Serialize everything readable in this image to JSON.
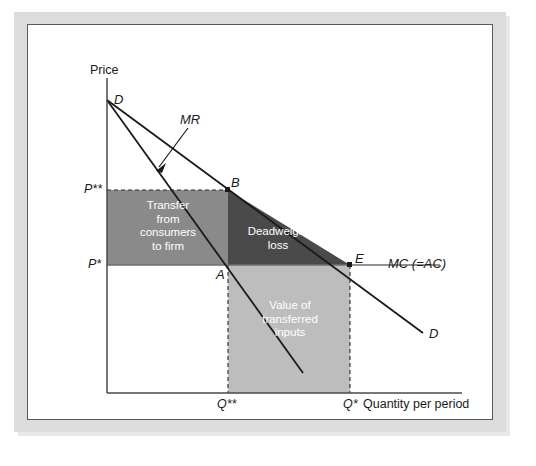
{
  "figure": {
    "kind": "economics-diagram",
    "axes": {
      "y_title": "Price",
      "x_title": "Quantity per period"
    },
    "price_ticks": [
      {
        "label": "P**",
        "y": 190
      },
      {
        "label": "P*",
        "y": 265
      }
    ],
    "quantity_ticks": [
      {
        "label": "Q**",
        "x": 228
      },
      {
        "label": "Q*",
        "x": 350
      }
    ],
    "curves": [
      {
        "name": "demand-upper-label",
        "label": "D"
      },
      {
        "name": "demand-lower-label",
        "label": "D"
      },
      {
        "name": "marginal-revenue",
        "label": "MR"
      },
      {
        "name": "marginal-cost",
        "label": "MC (=AC)"
      }
    ],
    "points": [
      {
        "name": "point-b",
        "label": "B",
        "x": 228,
        "y": 190
      },
      {
        "name": "point-a",
        "label": "A",
        "x": 228,
        "y": 265
      },
      {
        "name": "point-e",
        "label": "E",
        "x": 350,
        "y": 265
      }
    ],
    "regions": [
      {
        "name": "transfer-region",
        "label": "Transfer\nfrom\nconsumers\nto firm",
        "color": "#8a8a8a"
      },
      {
        "name": "deadweight-loss-region",
        "label": "Deadweight\nloss",
        "color": "#4a4a4a"
      },
      {
        "name": "transferred-inputs-region",
        "label": "Value of\ntransferred\ninputs",
        "color": "#bdbdbd"
      }
    ],
    "colors": {
      "line": "#1a1a1a",
      "mc_line": "#6e6e6e",
      "mat": "#dcdcdc",
      "panel": "#ffffff",
      "frame": "#5a5a5a"
    }
  }
}
